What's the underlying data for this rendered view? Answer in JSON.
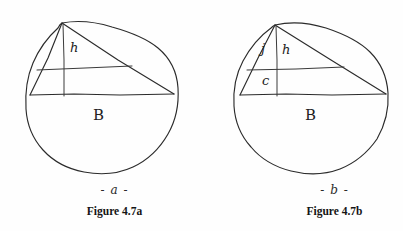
{
  "page": {
    "background_color": "#fefefe",
    "ink_color": "#2b2b2b"
  },
  "figures": [
    {
      "id": "figure-a",
      "sub_label": "- a -",
      "caption": "Figure 4.7a",
      "shape": "circle",
      "description": "Hand-drawn circle with an inscribed triangle on a horizontal diameter",
      "labels": {
        "height": "h",
        "base": "B"
      }
    },
    {
      "id": "figure-b",
      "sub_label": "- b -",
      "caption": "Figure 4.7b",
      "shape": "circle",
      "description": "Hand-drawn circle with an inscribed triangle on a horizontal diameter, divided by a horizontal line",
      "labels": {
        "upper_segment": "j",
        "height": "h",
        "lower_segment": "c",
        "base": "B"
      }
    }
  ]
}
